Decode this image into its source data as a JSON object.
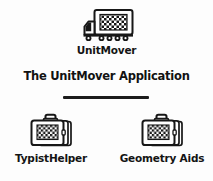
{
  "canvas": {
    "width": 213,
    "height": 181,
    "background_color": "#fdfdfd",
    "ink_color": "#141414"
  },
  "heading": {
    "text": "The UnitMover Application"
  },
  "divider": {
    "name": "horizontal-rule",
    "color": "#1c1c1c"
  },
  "nodes": {
    "truck": {
      "label": "UnitMover",
      "icon": "truck-icon",
      "icon_detail": "box truck with checkered cargo panel, cab at left, six wheels"
    },
    "typist": {
      "label": "TypistHelper",
      "icon": "briefcase-icon",
      "icon_detail": "suitcase with handle and checkered front panel"
    },
    "geometry": {
      "label": "Geometry Aids",
      "icon": "briefcase-icon",
      "icon_detail": "suitcase with handle and checkered front panel"
    }
  }
}
